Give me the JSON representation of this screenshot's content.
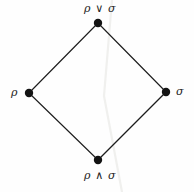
{
  "figure": {
    "kind": "hasse-diagram",
    "caption": "",
    "background_color": "#fefefe",
    "ink_color": "#1d1d1d",
    "artifact_color": "#f0f0ee"
  },
  "diagram_data": {
    "type": "diagram",
    "shape": "diamond-lattice",
    "nodes": [
      {
        "id": "join",
        "label": "ρ ∨ σ",
        "x": 98,
        "y": 23,
        "radius": 4,
        "label_position": "above"
      },
      {
        "id": "rho",
        "label": "ρ",
        "x": 29,
        "y": 93,
        "radius": 4,
        "label_position": "left"
      },
      {
        "id": "sigma",
        "label": "σ",
        "x": 166,
        "y": 92,
        "radius": 4,
        "label_position": "right"
      },
      {
        "id": "meet",
        "label": "ρ ∧ σ",
        "x": 98,
        "y": 160,
        "radius": 4,
        "label_position": "below"
      }
    ],
    "edges": [
      {
        "from": "rho",
        "to": "join"
      },
      {
        "from": "join",
        "to": "sigma"
      },
      {
        "from": "rho",
        "to": "meet"
      },
      {
        "from": "meet",
        "to": "sigma"
      }
    ],
    "labels": {
      "top": "ρ ∨ σ",
      "left": "ρ",
      "right": "σ",
      "bottom": "ρ ∧ σ"
    }
  }
}
